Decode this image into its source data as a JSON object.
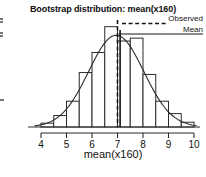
{
  "chart_data": {
    "type": "bar",
    "title": "Bootstrap distribution: mean(x160)",
    "xlabel": "mean(x160)",
    "ylabel": "",
    "xlim": [
      3.75,
      10.15
    ],
    "ylim": [
      0,
      112
    ],
    "grid": false,
    "x_ticks": [
      "4",
      "5",
      "6",
      "7",
      "8",
      "9",
      "10"
    ],
    "x_tick_values": [
      4,
      5,
      6,
      7,
      8,
      9,
      10
    ],
    "bin_width": 0.5,
    "bin_starts": [
      4.0,
      4.5,
      5.0,
      5.5,
      6.0,
      6.5,
      7.0,
      7.5,
      8.0,
      8.5,
      9.0,
      9.5
    ],
    "categories": [
      "4.0-4.5",
      "4.5-5.0",
      "5.0-5.5",
      "5.5-6.0",
      "6.0-6.5",
      "6.5-7.0",
      "7.0-7.5",
      "7.5-8.0",
      "8.0-8.5",
      "8.5-9.0",
      "9.0-9.5",
      "9.5-10.0"
    ],
    "values": [
      4,
      12,
      27,
      57,
      78,
      105,
      90,
      93,
      55,
      27,
      14,
      5
    ],
    "overlay": {
      "type": "density-curve",
      "label": "normal density",
      "mean": 6.95,
      "sd": 1.08,
      "peak_value": 96
    },
    "reference_lines": [
      {
        "name": "Observed",
        "style": "dashed",
        "x": 7.0
      },
      {
        "name": "Mean",
        "style": "solid",
        "x": 7.0
      }
    ],
    "legend": {
      "position": "top-right",
      "entries": [
        {
          "label": "Observed",
          "style": "dashed"
        },
        {
          "label": "Mean",
          "style": "solid"
        }
      ]
    }
  },
  "legend": {
    "observed_label": "Observed",
    "mean_label": "Mean"
  },
  "axis": {
    "x_title": "mean(x160)"
  }
}
